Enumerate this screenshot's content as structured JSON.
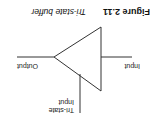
{
  "caption": {
    "number": "Figure 2.11",
    "title": "Tri-state buffer"
  },
  "diagram": {
    "symbol": "tri-state-buffer",
    "labels": {
      "input": "Input",
      "output": "Output",
      "control_line1": "Tri-state",
      "control_line2": "Input"
    },
    "orientation": "rotated 180 degrees",
    "line_color": "#333333"
  }
}
